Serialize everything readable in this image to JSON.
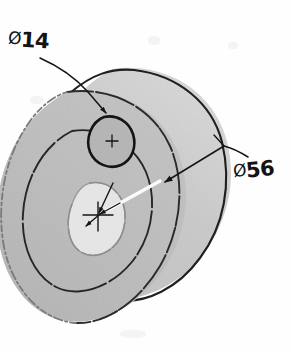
{
  "sheet": {
    "width": 291,
    "height": 352,
    "background_color": "#fefefe",
    "media": "scanned-paper"
  },
  "drawing": {
    "title": "Isometric pictorial of a cylindrical disc with bore and one hole",
    "projection": "isometric",
    "linework_color": "#1a1a1a",
    "colors": {
      "front_face_shade": "#b9b9b9",
      "back_face_shade": "#c9c9c9",
      "side_band_light": "#f2f2f2",
      "side_band_shade": "#d9d9d9",
      "bore_fill": "#e9e9e9",
      "outline": "#1a1a1a",
      "faint_outline": "#8a8a8a"
    }
  },
  "dimensions": [
    {
      "id": "hole-diameter",
      "symbol": "Ø",
      "value": "14",
      "label": "Ø14",
      "feature": "small through hole on front face",
      "leader": "from label down-right to hole, arrowhead at hole"
    },
    {
      "id": "outer-diameter",
      "symbol": "Ø",
      "value": "56",
      "label": "Ø56",
      "feature": "outer diameter of disc",
      "leader": "from label down-left across the face, arrowhead at outer edge"
    }
  ],
  "labels": {
    "d14": {
      "symbol": "Ø",
      "value": "14"
    },
    "d56": {
      "symbol": "Ø",
      "value": "56"
    }
  },
  "features": [
    {
      "name": "outer-cylinder",
      "description": "outer cylindrical body, diameter 56"
    },
    {
      "name": "center-bore",
      "description": "central bore with center cross mark"
    },
    {
      "name": "small-hole",
      "description": "hole of diameter 14 on the front face"
    },
    {
      "name": "concentric-circle",
      "description": "intermediate concentric circle on front face"
    },
    {
      "name": "center-mark",
      "description": "cross-hair center marks"
    }
  ]
}
